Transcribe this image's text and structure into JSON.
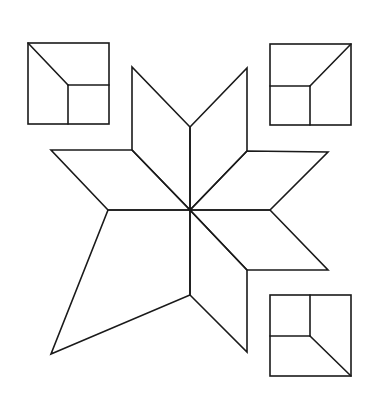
{
  "diagram": {
    "title": "",
    "stroke_color": "#1a1a1a",
    "background": "#ffffff",
    "center": [
      190,
      210
    ],
    "star": {
      "name": "eight-point-star-with-missing-piece",
      "pieces": [
        {
          "id": "rhombus-top-left",
          "points": [
            [
              190,
              210
            ],
            [
              132,
              150
            ],
            [
              132,
              67
            ],
            [
              190,
              127
            ]
          ]
        },
        {
          "id": "rhombus-top-right",
          "points": [
            [
              190,
              210
            ],
            [
              190,
              127
            ],
            [
              247,
              68
            ],
            [
              247,
              151
            ]
          ]
        },
        {
          "id": "rhombus-right-upper",
          "points": [
            [
              190,
              210
            ],
            [
              247,
              151
            ],
            [
              328,
              152
            ],
            [
              270,
              210
            ]
          ]
        },
        {
          "id": "rhombus-right-lower",
          "points": [
            [
              190,
              210
            ],
            [
              270,
              210
            ],
            [
              328,
              270
            ],
            [
              247,
              270
            ]
          ]
        },
        {
          "id": "rhombus-bottom-right",
          "points": [
            [
              190,
              210
            ],
            [
              247,
              270
            ],
            [
              247,
              352
            ],
            [
              190,
              295
            ]
          ]
        },
        {
          "id": "quadrilateral-bottom-left",
          "points": [
            [
              190,
              210
            ],
            [
              190,
              295
            ],
            [
              51,
              354
            ],
            [
              108,
              210
            ]
          ]
        },
        {
          "id": "rhombus-left-upper",
          "points": [
            [
              190,
              210
            ],
            [
              108,
              210
            ],
            [
              51,
              150
            ],
            [
              132,
              150
            ]
          ]
        }
      ]
    },
    "squares": [
      {
        "id": "square-top-left",
        "x": 28,
        "y": 43,
        "size": 81,
        "inner": [
          68,
          85
        ],
        "diagonal_corner": "top-left"
      },
      {
        "id": "square-top-right",
        "x": 270,
        "y": 44,
        "size": 81,
        "inner": [
          310,
          86
        ],
        "diagonal_corner": "top-right"
      },
      {
        "id": "square-bottom-right",
        "x": 270,
        "y": 295,
        "size": 81,
        "inner": [
          310,
          336
        ],
        "diagonal_corner": "bottom-right"
      }
    ]
  }
}
